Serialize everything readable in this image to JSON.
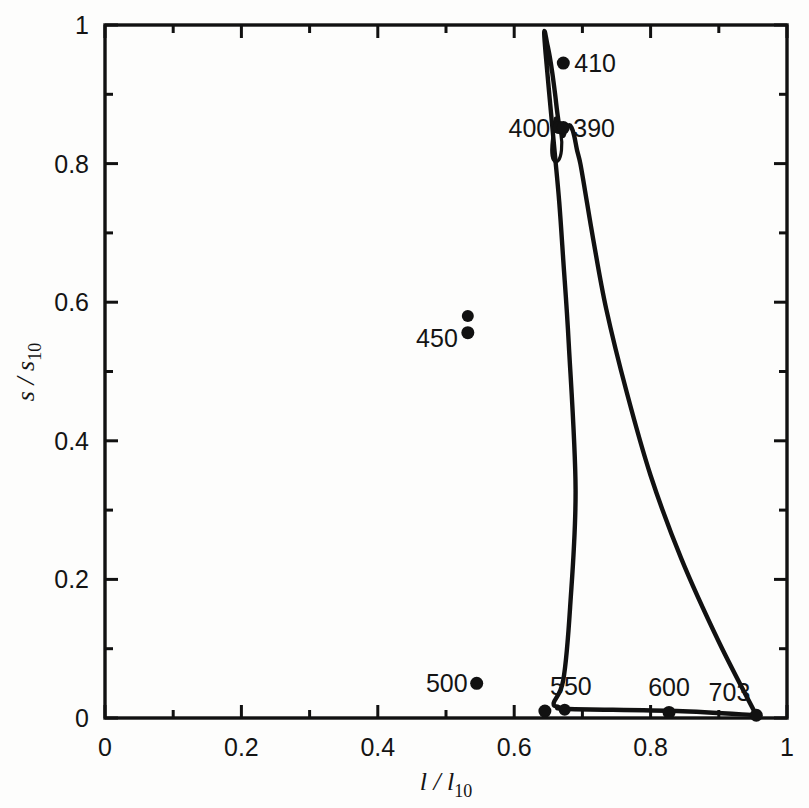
{
  "figure": {
    "background_color": "#fdfdfc",
    "ink_color": "#111111"
  },
  "chart_data": {
    "type": "line",
    "title": "",
    "subtitle": "",
    "xlabel_parts": {
      "symbol": "l / l",
      "subscript": "10"
    },
    "ylabel_parts": {
      "symbol": "s / s",
      "subscript": "10"
    },
    "xlabel": "l / l10",
    "ylabel": "s / s10",
    "xlim": [
      0,
      1
    ],
    "ylim": [
      0,
      1
    ],
    "grid": false,
    "legend": "none",
    "xticks": [
      "0",
      "0.2",
      "0.4",
      "0.6",
      "0.8",
      "1"
    ],
    "xtick_values": [
      0,
      0.2,
      0.4,
      0.6,
      0.8,
      1
    ],
    "yticks": [
      "0",
      "0.2",
      "0.4",
      "0.6",
      "0.8",
      "1"
    ],
    "ytick_values": [
      0,
      0.2,
      0.4,
      0.6,
      0.8,
      1
    ],
    "minor_tick_step": 0.1,
    "series": [
      {
        "name": "spectrum locus",
        "description": "closed chromaticity locus with purple line",
        "x": [
          0.955,
          0.838,
          0.68,
          0.665,
          0.658,
          0.672,
          0.682,
          0.69,
          0.68,
          0.672,
          0.666,
          0.659,
          0.651,
          0.646,
          0.644,
          0.645,
          0.648,
          0.652,
          0.656,
          0.66,
          0.663,
          0.666,
          0.669,
          0.672,
          0.675,
          0.68,
          0.684,
          0.688,
          0.692,
          0.697,
          0.704,
          0.716,
          0.735,
          0.765,
          0.8,
          0.845,
          0.9,
          0.955
        ],
        "y": [
          0.004,
          0.01,
          0.013,
          0.016,
          0.022,
          0.055,
          0.16,
          0.33,
          0.54,
          0.66,
          0.745,
          0.82,
          0.905,
          0.96,
          0.987,
          0.99,
          0.975,
          0.955,
          0.93,
          0.9,
          0.875,
          0.855,
          0.845,
          0.84,
          0.848,
          0.855,
          0.852,
          0.84,
          0.82,
          0.8,
          0.76,
          0.69,
          0.59,
          0.47,
          0.35,
          0.23,
          0.11,
          0.004
        ]
      }
    ],
    "annotated_points": [
      {
        "label": "410",
        "x": 0.672,
        "y": 0.945,
        "label_anchor": "start",
        "label_dx": 11,
        "label_dy": 9
      },
      {
        "label": "400",
        "x": 0.666,
        "y": 0.852,
        "label_anchor": "end",
        "label_dx": -9,
        "label_dy": 9
      },
      {
        "label": "390",
        "x": 0.672,
        "y": 0.852,
        "label_anchor": "start",
        "label_dx": 10,
        "label_dy": 9
      },
      {
        "label": "450",
        "x": 0.532,
        "y": 0.556,
        "label_anchor": "end",
        "label_dx": -10,
        "label_dy": 14
      },
      {
        "label": "500",
        "x": 0.545,
        "y": 0.05,
        "label_anchor": "end",
        "label_dx": -9,
        "label_dy": 9
      },
      {
        "label": "550",
        "x": 0.645,
        "y": 0.01,
        "label_anchor": "middle",
        "label_dx": 26,
        "label_dy": -16
      },
      {
        "label": "600",
        "x": 0.827,
        "y": 0.008,
        "label_anchor": "middle",
        "label_dx": 0,
        "label_dy": -16
      },
      {
        "label": "703",
        "x": 0.955,
        "y": 0.004,
        "label_anchor": "end",
        "label_dx": -6,
        "label_dy": -14
      }
    ],
    "extra_markers": [
      {
        "x": 0.532,
        "y": 0.58
      },
      {
        "x": 0.674,
        "y": 0.012
      }
    ]
  }
}
